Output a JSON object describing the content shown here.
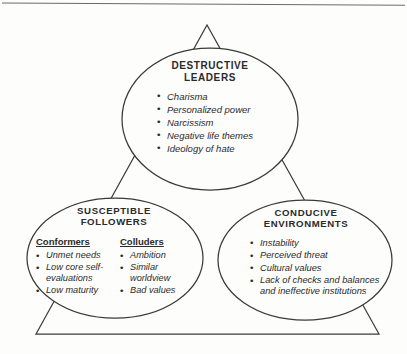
{
  "diagram": {
    "line_color": "#3a3a3a",
    "background_color": "#fdfdfc",
    "text_color": "#2b2b2b",
    "nodes": {
      "leaders": {
        "heading_line1": "DESTRUCTIVE",
        "heading_line2": "LEADERS",
        "items": [
          "Charisma",
          "Personalized power",
          "Narcissism",
          "Negative life themes",
          "Ideology of hate"
        ]
      },
      "followers": {
        "heading_line1": "SUSCEPTIBLE",
        "heading_line2": "FOLLOWERS",
        "columns": [
          {
            "title": "Conformers",
            "items": [
              "Unmet needs",
              "Low core self-evaluations",
              "Low maturity"
            ]
          },
          {
            "title": "Colluders",
            "items": [
              "Ambition",
              "Similar worldview",
              "Bad values"
            ]
          }
        ]
      },
      "environments": {
        "heading_line1": "CONDUCIVE",
        "heading_line2": "ENVIRONMENTS",
        "items": [
          "Instability",
          "Perceived threat",
          "Cultural values",
          "Lack of checks and balances and ineffective institutions"
        ]
      }
    }
  }
}
